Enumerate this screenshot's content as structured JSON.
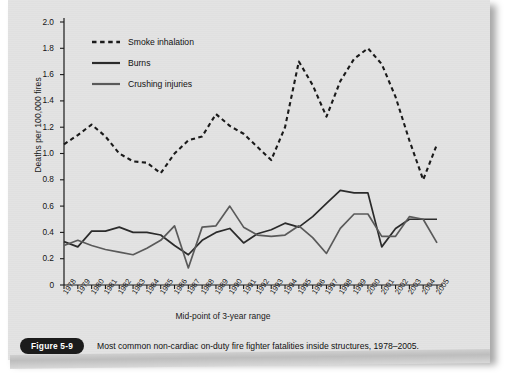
{
  "figure": {
    "badge": "Figure 5-9",
    "caption": "Most common non-cardiac on-duty fire fighter fatalities inside structures, 1978–2005."
  },
  "chart_data": {
    "type": "line",
    "title": "",
    "xlabel": "Mid-point of 3-year range",
    "ylabel": "Deaths per 100,000 fires",
    "ylim": [
      0,
      2.0
    ],
    "yticks": [
      "0",
      "0.2",
      "0.4",
      "0.6",
      "0.8",
      "1.0",
      "1.2",
      "1.4",
      "1.6",
      "1.8",
      "2.0"
    ],
    "ytick_values": [
      0,
      0.2,
      0.4,
      0.6,
      0.8,
      1.0,
      1.2,
      1.4,
      1.6,
      1.8,
      2.0
    ],
    "grid": false,
    "legend_position": "top-left",
    "categories": [
      "1978",
      "1979",
      "1980",
      "1981",
      "1982",
      "1983",
      "1984",
      "1985",
      "1986",
      "1987",
      "1988",
      "1989",
      "1990",
      "1991",
      "1992",
      "1993",
      "1994",
      "1995",
      "1996",
      "1997",
      "1998",
      "1999",
      "2000",
      "2001",
      "2002",
      "2003",
      "2004",
      "2005"
    ],
    "x": [
      1978,
      1979,
      1980,
      1981,
      1982,
      1983,
      1984,
      1985,
      1986,
      1987,
      1988,
      1989,
      1990,
      1991,
      1992,
      1993,
      1994,
      1995,
      1996,
      1997,
      1998,
      1999,
      2000,
      2001,
      2002,
      2003,
      2004,
      2005
    ],
    "series": [
      {
        "name": "Smoke inhalation",
        "style": "dashed",
        "color": "#1a1a1a",
        "values": [
          1.07,
          1.14,
          1.22,
          1.13,
          1.0,
          0.94,
          0.93,
          0.85,
          1.0,
          1.1,
          1.13,
          1.3,
          1.21,
          1.15,
          1.05,
          0.95,
          1.2,
          1.7,
          1.52,
          1.28,
          1.55,
          1.72,
          1.8,
          1.68,
          1.43,
          1.1,
          0.8,
          1.07
        ]
      },
      {
        "name": "Burns",
        "style": "solid",
        "color": "#2b2b2b",
        "values": [
          0.33,
          0.29,
          0.41,
          0.41,
          0.44,
          0.4,
          0.4,
          0.38,
          0.3,
          0.23,
          0.34,
          0.4,
          0.43,
          0.32,
          0.39,
          0.42,
          0.47,
          0.44,
          0.52,
          0.62,
          0.72,
          0.7,
          0.7,
          0.29,
          0.43,
          0.5,
          0.5,
          0.5
        ]
      },
      {
        "name": "Crushing injuries",
        "style": "solid",
        "color": "#5a5a5a",
        "values": [
          0.3,
          0.34,
          0.3,
          0.27,
          0.25,
          0.23,
          0.28,
          0.34,
          0.45,
          0.13,
          0.44,
          0.45,
          0.6,
          0.44,
          0.38,
          0.37,
          0.38,
          0.45,
          0.36,
          0.24,
          0.43,
          0.54,
          0.54,
          0.37,
          0.37,
          0.52,
          0.5,
          0.32
        ]
      }
    ]
  }
}
